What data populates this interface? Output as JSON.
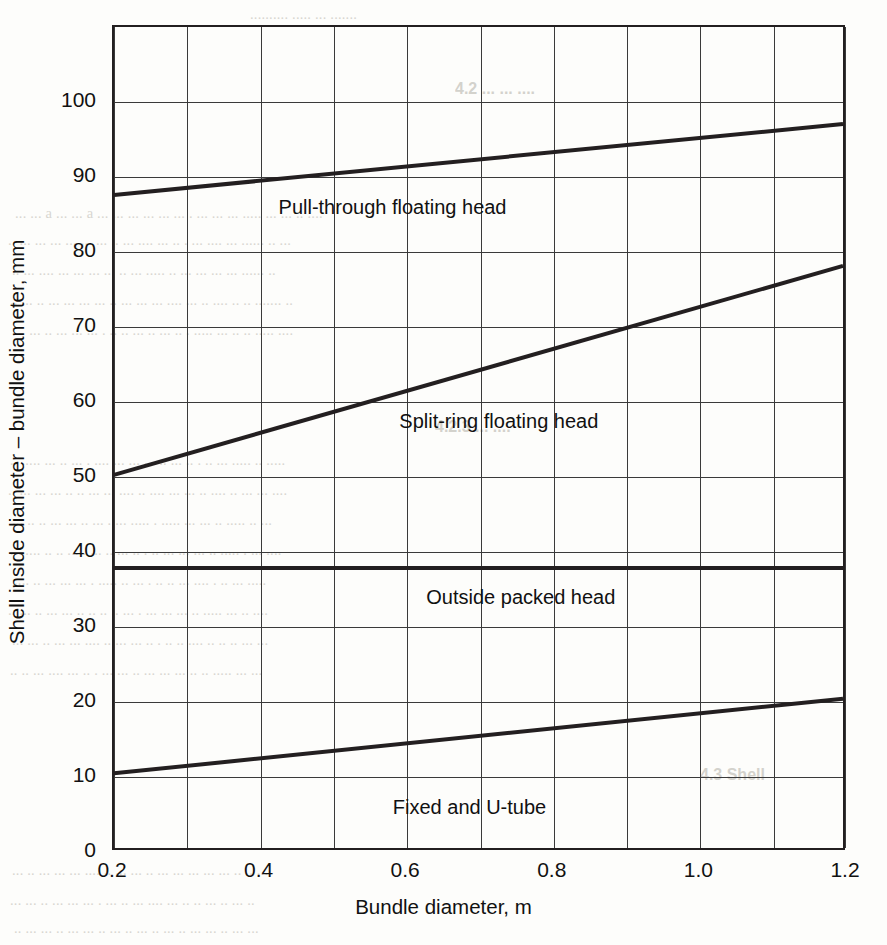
{
  "chart_data": {
    "type": "line",
    "title": "",
    "xlabel": "Bundle diameter, m",
    "ylabel": "Shell inside diameter – bundle diameter, mm",
    "xlim": [
      0.2,
      1.2
    ],
    "ylim": [
      0,
      110
    ],
    "xticks": [
      0.2,
      0.4,
      0.6,
      0.8,
      1.0,
      1.2
    ],
    "xtick_labels": [
      "0.2",
      "0.4",
      "0.6",
      "0.8",
      "1.0",
      "1.2"
    ],
    "x_gridlines": [
      0.2,
      0.3,
      0.4,
      0.5,
      0.6,
      0.7,
      0.8,
      0.9,
      1.0,
      1.1,
      1.2
    ],
    "yticks": [
      0,
      10,
      20,
      30,
      40,
      50,
      60,
      70,
      80,
      90,
      100
    ],
    "ytick_labels": [
      "0",
      "10",
      "20",
      "30",
      "40",
      "50",
      "60",
      "70",
      "80",
      "90",
      "100"
    ],
    "y_gridlines": [
      0,
      10,
      20,
      30,
      40,
      50,
      60,
      70,
      80,
      90,
      100
    ],
    "grid": true,
    "legend": "inline-annotations",
    "line_color": "#231f20",
    "series": [
      {
        "name": "Pull-through floating head",
        "x": [
          0.2,
          1.2
        ],
        "values": [
          87.5,
          97.0
        ],
        "label_x": 0.58,
        "label_y": 86.0
      },
      {
        "name": "Split-ring floating head",
        "x": [
          0.2,
          1.2
        ],
        "values": [
          50.0,
          78.0
        ],
        "label_x": 0.725,
        "label_y": 57.5
      },
      {
        "name": "Outside packed head",
        "x": [
          0.2,
          1.2
        ],
        "values": [
          37.5,
          37.5
        ],
        "label_x": 0.755,
        "label_y": 34.0
      },
      {
        "name": "Fixed and U-tube",
        "x": [
          0.2,
          1.2
        ],
        "values": [
          10.0,
          20.0
        ],
        "label_x": 0.685,
        "label_y": 6.0
      }
    ]
  },
  "page_bleed": {
    "top_line": "... under ...",
    "right_column": [
      "head ... floating head",
      "to a tube sheet ... and ... packed head ... with a",
      "floating head ... the ... Where ... the ... bundle",
      "head diameter ... from the shell inside diameter ...",
      "head ... to ... The clearances ... the ... between",
      "a ... shell inside diameter and the ... will ... be ... on the",
      "... on the type ... used ... and ... the ... are ... can",
      "... shell inside ... between ... the ... head ... (Fig. ...)"
    ],
    "right_heading_1": "4.2 ... heads",
    "right_mid": [
      "... of ... has a ... to ... and ... may ... be ...",
      "... of ... tubes ... and ... to ... is ... been ... in the ... used ...",
      "... the ... to ... the ... to ... the ... shell ... and ...",
      "... shell ... and the ... than ... to ... outer ... tube ... diameter",
      "... diameter ... and ... a ... is ... the ... ... ... ...",
      "... and ... tube ... of the ... and ... of the ... head ... the ...",
      "... are ... and ... tube ... the ... is ... the ... ... are ...",
      "... ... ..."
    ],
    "right_heading_2": "4.3 Shell",
    "right_bottom": [
      "... shell ... and ... the ... shell ... is ... to ... ... ...",
      "... diameter ... the ... the ... shell ... may ... to ... the ...",
      "... ... ... ... the ... the ... to ... ..."
    ]
  }
}
